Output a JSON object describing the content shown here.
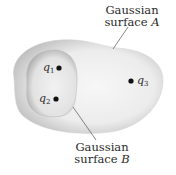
{
  "diagram": {
    "type": "gaussian-surfaces",
    "surfaces": [
      {
        "id": "A",
        "label_line1": "Gaussian",
        "label_line2_prefix": "surface ",
        "label_letter": "A",
        "contains": [
          "q1",
          "q2",
          "q3"
        ]
      },
      {
        "id": "B",
        "label_line1": "Gaussian",
        "label_line2_prefix": "surface ",
        "label_letter": "B",
        "contains": [
          "q1",
          "q2"
        ]
      }
    ],
    "charges": [
      {
        "id": "q1",
        "symbol": "q",
        "subscript": "1"
      },
      {
        "id": "q2",
        "symbol": "q",
        "subscript": "2"
      },
      {
        "id": "q3",
        "symbol": "q",
        "subscript": "3"
      }
    ],
    "colors": {
      "surface_fill": "#e6e6e6",
      "surface_edge": "#bdbdbd",
      "charge": "#111111",
      "text": "#2a2a2a",
      "leader_line": "#555555"
    }
  }
}
